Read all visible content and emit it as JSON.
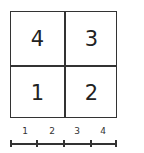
{
  "grid": {
    "cells": [
      {
        "position": "top-left",
        "label": "4"
      },
      {
        "position": "top-right",
        "label": "3"
      },
      {
        "position": "bottom-left",
        "label": "1"
      },
      {
        "position": "bottom-right",
        "label": "2"
      }
    ]
  },
  "scale": {
    "labels": [
      "1",
      "2",
      "3",
      "4"
    ],
    "ticks": 5
  }
}
